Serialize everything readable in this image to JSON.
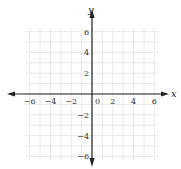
{
  "chart_data": {
    "type": "scatter",
    "title": "",
    "xlabel": "x",
    "ylabel": "y",
    "xlim": [
      -6,
      6
    ],
    "ylim": [
      -6,
      6
    ],
    "grid": true,
    "grid_step": 1,
    "x_ticks": [
      -6,
      -4,
      -2,
      0,
      2,
      4,
      6
    ],
    "y_ticks": [
      -6,
      -4,
      -2,
      2,
      4,
      6
    ],
    "x_tick_labels": [
      "−6",
      "−4",
      "−2",
      "0",
      "2",
      "4",
      "6"
    ],
    "y_tick_labels": [
      "−6",
      "−4",
      "−2",
      "2",
      "4",
      "6"
    ],
    "series": [],
    "legend": null
  },
  "colors": {
    "axis": "#222222",
    "grid": "#e4e4e4",
    "background": "#ffffff"
  }
}
